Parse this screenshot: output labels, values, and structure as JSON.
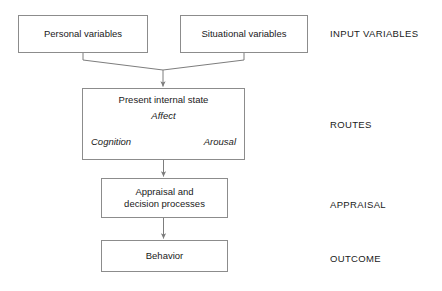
{
  "diagram": {
    "stroke_color": "#8c8c8c",
    "text_color": "#1a1a1a",
    "background": "#ffffff"
  },
  "nodes": {
    "personal": {
      "label": "Personal variables"
    },
    "situational": {
      "label": "Situational variables"
    },
    "internal": {
      "title": "Present internal state",
      "routes": {
        "affect": "Affect",
        "cognition": "Cognition",
        "arousal": "Arousal"
      }
    },
    "appraisal": {
      "label": "Appraisal and\ndecision processes"
    },
    "behavior": {
      "label": "Behavior"
    }
  },
  "stage_labels": {
    "input": "INPUT VARIABLES",
    "routes": "ROUTES",
    "appraisal": "APPRAISAL",
    "outcome": "OUTCOME"
  },
  "connectors": [
    {
      "name": "personal-to-internal",
      "style": "solid",
      "arrow": "single"
    },
    {
      "name": "situational-to-internal",
      "style": "solid",
      "arrow": "single"
    },
    {
      "name": "internal-to-appraisal",
      "style": "solid",
      "arrow": "single"
    },
    {
      "name": "appraisal-to-behavior",
      "style": "solid",
      "arrow": "single"
    },
    {
      "name": "affect-cognition",
      "style": "dashed",
      "arrow": "double"
    },
    {
      "name": "affect-arousal",
      "style": "dashed",
      "arrow": "double"
    },
    {
      "name": "cognition-arousal",
      "style": "dotted",
      "arrow": "double"
    }
  ]
}
